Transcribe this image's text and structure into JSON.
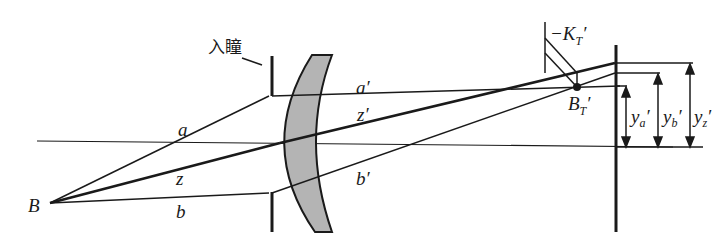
{
  "diagram": {
    "labels": {
      "entrance_pupil": "入瞳",
      "point_B": "B",
      "ray_a": "a",
      "ray_z": "z",
      "ray_b": "b",
      "ray_a_prime": "a′",
      "ray_z_prime": "z′",
      "ray_b_prime": "b′",
      "focus_point": "B",
      "focus_point_sub": "T",
      "focus_point_prime": "′",
      "k_label": "−K",
      "k_sub": "T",
      "k_prime": "′",
      "ya": "y",
      "ya_sub": "a",
      "yb": "y",
      "yb_sub": "b",
      "yz": "y",
      "yz_sub": "z",
      "prime": "′"
    },
    "colors": {
      "line": "#1a1a1a",
      "lens_fill": "#b4b4b4"
    }
  }
}
